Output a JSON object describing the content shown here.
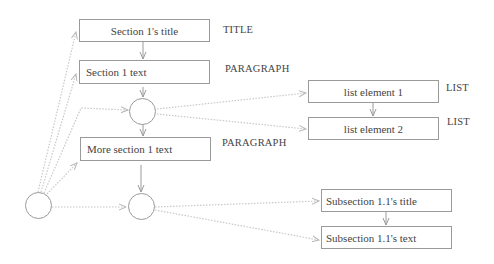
{
  "diagram": {
    "nodes": {
      "section_title": {
        "label": "Section 1's title",
        "type": "TITLE"
      },
      "section_text": {
        "label": "Section 1 text",
        "type": "PARAGRAPH"
      },
      "list_item_1": {
        "label": "list element 1",
        "type": "LIST"
      },
      "list_item_2": {
        "label": "list element 2",
        "type": "LIST"
      },
      "more_text": {
        "label": "More section 1 text",
        "type": "PARAGRAPH"
      },
      "subsection_title": {
        "label": "Subsection 1.1's title"
      },
      "subsection_text": {
        "label": "Subsection 1.1's text"
      }
    },
    "colors": {
      "line": "#9a9a9a",
      "dotted_line": "#c8c8c8",
      "text": "#444444"
    }
  }
}
